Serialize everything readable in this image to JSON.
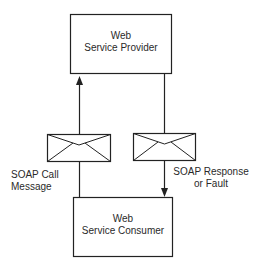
{
  "diagram": {
    "nodes": [
      {
        "id": "provider",
        "line1": "Web",
        "line2": "Service Provider"
      },
      {
        "id": "consumer",
        "line1": "Web",
        "line2": "Service Consumer"
      }
    ],
    "edges": [
      {
        "from": "consumer",
        "to": "provider",
        "label_line1": "SOAP Call",
        "label_line2": "Message",
        "icon": "envelope-icon"
      },
      {
        "from": "provider",
        "to": "consumer",
        "label_line1": "SOAP Response",
        "label_line2": "or Fault",
        "icon": "envelope-icon"
      }
    ],
    "colors": {
      "stroke": "#222222",
      "background": "#ffffff"
    }
  }
}
